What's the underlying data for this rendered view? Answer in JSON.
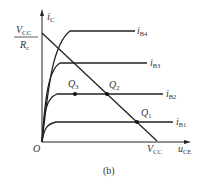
{
  "diagram": {
    "caption": "(b)",
    "y_axis": {
      "label": "i",
      "sub": "C"
    },
    "x_axis": {
      "label": "u",
      "sub": "CE"
    },
    "origin": "O",
    "y_intercept": {
      "num": "V",
      "num_sub": "CC",
      "den": "R",
      "den_sub": "c"
    },
    "x_intercept": {
      "label": "V",
      "sub": "CC"
    },
    "curves": [
      {
        "label": "i",
        "sub": "B4"
      },
      {
        "label": "i",
        "sub": "B3"
      },
      {
        "label": "i",
        "sub": "B2"
      },
      {
        "label": "i",
        "sub": "B1"
      }
    ],
    "points": [
      {
        "label": "Q",
        "sub": "3"
      },
      {
        "label": "Q",
        "sub": "2"
      },
      {
        "label": "Q",
        "sub": "1"
      }
    ],
    "colors": {
      "line": "#222222",
      "text": "#333333"
    }
  }
}
